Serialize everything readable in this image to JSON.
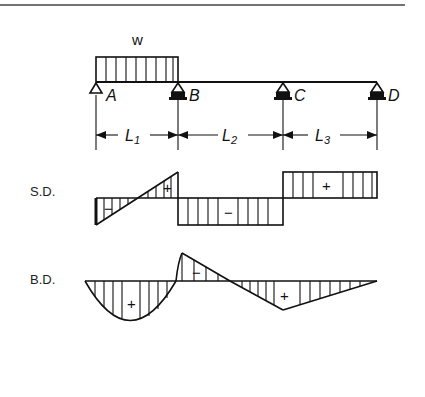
{
  "figure": {
    "load_label": "w",
    "supports": [
      {
        "id": "A",
        "label": "A",
        "type": "pin"
      },
      {
        "id": "B",
        "label": "B",
        "type": "roller"
      },
      {
        "id": "C",
        "label": "C",
        "type": "roller"
      },
      {
        "id": "D",
        "label": "D",
        "type": "roller"
      }
    ],
    "spans": [
      {
        "label": "L",
        "sub": "1"
      },
      {
        "label": "L",
        "sub": "2"
      },
      {
        "label": "L",
        "sub": "3"
      }
    ],
    "shear_diagram": {
      "label": "S.D.",
      "signs": [
        "−",
        "+",
        "−",
        "+"
      ]
    },
    "bending_diagram": {
      "label": "B.D.",
      "signs": [
        "+",
        "−",
        "+"
      ]
    }
  }
}
